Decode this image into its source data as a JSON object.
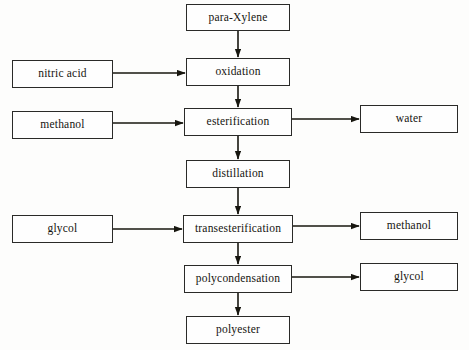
{
  "diagram": {
    "type": "process-flowchart",
    "background_color": "#fdfdfc",
    "box_border_color": "#2a2a28",
    "box_fill_color": "#fefefe",
    "arrow_color": "#17160f",
    "nodes": [
      {
        "id": "para-xylene",
        "label": "para-Xylene",
        "role": "feedstock",
        "column": "center",
        "x": 186,
        "y": 4,
        "w": 104,
        "h": 27,
        "font_size": 11.5
      },
      {
        "id": "nitric-acid",
        "label": "nitric acid",
        "role": "reactant",
        "column": "left",
        "x": 12,
        "y": 60,
        "w": 101,
        "h": 28,
        "font_size": 11.5
      },
      {
        "id": "oxidation",
        "label": "oxidation",
        "role": "process",
        "column": "center",
        "x": 186,
        "y": 58,
        "w": 104,
        "h": 28,
        "font_size": 11.5
      },
      {
        "id": "methanol-in",
        "label": "methanol",
        "role": "reactant",
        "column": "left",
        "x": 12,
        "y": 111,
        "w": 101,
        "h": 28,
        "font_size": 11.5
      },
      {
        "id": "esterification",
        "label": "esterification",
        "role": "process",
        "column": "center",
        "x": 184,
        "y": 108,
        "w": 108,
        "h": 28,
        "font_size": 11.5
      },
      {
        "id": "water",
        "label": "water",
        "role": "byproduct",
        "column": "right",
        "x": 360,
        "y": 105,
        "w": 98,
        "h": 28,
        "font_size": 11.5
      },
      {
        "id": "distillation",
        "label": "distillation",
        "role": "process",
        "column": "center",
        "x": 186,
        "y": 160,
        "w": 104,
        "h": 28,
        "font_size": 11.5
      },
      {
        "id": "glycol-in",
        "label": "glycol",
        "role": "reactant",
        "column": "left",
        "x": 12,
        "y": 215,
        "w": 101,
        "h": 28,
        "font_size": 11.5
      },
      {
        "id": "transesterification",
        "label": "transesterification",
        "role": "process",
        "column": "center",
        "x": 183,
        "y": 215,
        "w": 110,
        "h": 28,
        "font_size": 11.5
      },
      {
        "id": "methanol-out",
        "label": "methanol",
        "role": "byproduct",
        "column": "right",
        "x": 360,
        "y": 212,
        "w": 98,
        "h": 28,
        "font_size": 11.5
      },
      {
        "id": "polycondensation",
        "label": "polycondensation",
        "role": "process",
        "column": "center",
        "x": 184,
        "y": 265,
        "w": 108,
        "h": 28,
        "font_size": 11.5
      },
      {
        "id": "glycol-out",
        "label": "glycol",
        "role": "byproduct",
        "column": "right",
        "x": 360,
        "y": 263,
        "w": 98,
        "h": 28,
        "font_size": 11.5
      },
      {
        "id": "polyester",
        "label": "polyester",
        "role": "product",
        "column": "center",
        "x": 186,
        "y": 316,
        "w": 104,
        "h": 28,
        "font_size": 11.5
      }
    ],
    "edges": [
      {
        "id": "e-paraxylene-oxidation",
        "from": "para-xylene",
        "to": "oxidation",
        "direction": "down",
        "x1": 238,
        "y1": 31,
        "x2": 238,
        "y2": 58
      },
      {
        "id": "e-nitricacid-oxidation",
        "from": "nitric-acid",
        "to": "oxidation",
        "direction": "right",
        "x1": 113,
        "y1": 73,
        "x2": 186,
        "y2": 73
      },
      {
        "id": "e-oxidation-esterification",
        "from": "oxidation",
        "to": "esterification",
        "direction": "down",
        "x1": 238,
        "y1": 86,
        "x2": 238,
        "y2": 108
      },
      {
        "id": "e-methanol-esterification",
        "from": "methanol-in",
        "to": "esterification",
        "direction": "right",
        "x1": 113,
        "y1": 123,
        "x2": 184,
        "y2": 123
      },
      {
        "id": "e-esterification-water",
        "from": "esterification",
        "to": "water",
        "direction": "right",
        "x1": 292,
        "y1": 119,
        "x2": 360,
        "y2": 119
      },
      {
        "id": "e-esterification-distillation",
        "from": "esterification",
        "to": "distillation",
        "direction": "down",
        "x1": 238,
        "y1": 136,
        "x2": 238,
        "y2": 160
      },
      {
        "id": "e-distillation-transesterification",
        "from": "distillation",
        "to": "transesterification",
        "direction": "down",
        "x1": 238,
        "y1": 188,
        "x2": 238,
        "y2": 215
      },
      {
        "id": "e-glycol-transesterification",
        "from": "glycol-in",
        "to": "transesterification",
        "direction": "right",
        "x1": 113,
        "y1": 229,
        "x2": 183,
        "y2": 229
      },
      {
        "id": "e-transesterification-methanol",
        "from": "transesterification",
        "to": "methanol-out",
        "direction": "right",
        "x1": 293,
        "y1": 226,
        "x2": 360,
        "y2": 226
      },
      {
        "id": "e-transesterification-polycond",
        "from": "transesterification",
        "to": "polycondensation",
        "direction": "down",
        "x1": 238,
        "y1": 243,
        "x2": 238,
        "y2": 265
      },
      {
        "id": "e-polycond-glycol",
        "from": "polycondensation",
        "to": "glycol-out",
        "direction": "right",
        "x1": 292,
        "y1": 277,
        "x2": 360,
        "y2": 277
      },
      {
        "id": "e-polycond-polyester",
        "from": "polycondensation",
        "to": "polyester",
        "direction": "down",
        "x1": 238,
        "y1": 293,
        "x2": 238,
        "y2": 316
      }
    ]
  }
}
